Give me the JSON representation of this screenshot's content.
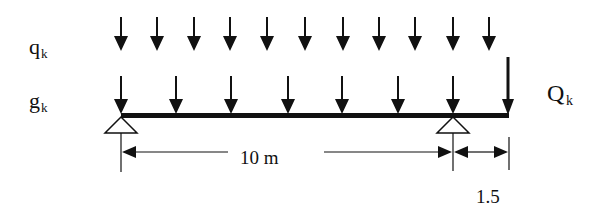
{
  "diagram": {
    "type": "beam-loading",
    "labels": {
      "variable_load": "q",
      "variable_load_sub": "k",
      "permanent_load": "g",
      "permanent_load_sub": "k",
      "point_load": "Q",
      "point_load_sub": "k"
    },
    "dimensions": {
      "span": "10 m",
      "cantilever": "1.5"
    },
    "colors": {
      "ink": "#111111",
      "background": "#ffffff"
    },
    "q_arrows_x": [
      121,
      157,
      194,
      230,
      267,
      305,
      343,
      379,
      415,
      453,
      489
    ],
    "g_arrows_x": [
      121,
      176,
      231,
      288,
      342,
      398,
      453
    ],
    "point_load_x": 508,
    "supports_x": [
      121,
      453
    ]
  }
}
